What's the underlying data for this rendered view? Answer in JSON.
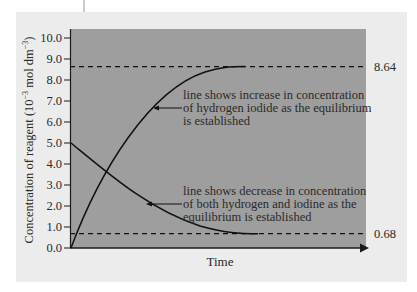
{
  "chart_data": {
    "type": "line",
    "title": "",
    "xlabel": "Time",
    "ylabel": "Concentration of reagent (10⁻³ mol dm⁻³)",
    "ylabel_parts": {
      "main": "Concentration of reagent (10",
      "exp1": "−3",
      "mid": " mol dm",
      "exp2": "−3",
      "end": ")"
    },
    "ylim": [
      0,
      10
    ],
    "yticks": [
      "0.0",
      "1.0",
      "2.0",
      "3.0",
      "4.0",
      "5.0",
      "6.0",
      "7.0",
      "8.0",
      "9.0",
      "10.0"
    ],
    "grid": false,
    "x_is_unlabeled_time": true,
    "series": [
      {
        "name": "hydrogen iodide",
        "trend": "increase",
        "start": 0.0,
        "equilibrium": 8.64,
        "points": [
          [
            0,
            0.0
          ],
          [
            0.1,
            3.1
          ],
          [
            0.2,
            5.6
          ],
          [
            0.3,
            7.3
          ],
          [
            0.4,
            8.3
          ],
          [
            0.5,
            8.64
          ],
          [
            0.55,
            8.64
          ]
        ]
      },
      {
        "name": "hydrogen and iodine",
        "trend": "decrease",
        "start": 5.0,
        "equilibrium": 0.68,
        "points": [
          [
            0,
            5.0
          ],
          [
            0.1,
            3.3
          ],
          [
            0.2,
            2.1
          ],
          [
            0.3,
            1.3
          ],
          [
            0.4,
            0.9
          ],
          [
            0.5,
            0.72
          ],
          [
            0.6,
            0.68
          ]
        ]
      }
    ],
    "reference_lines": [
      {
        "value": 8.64,
        "label": "8.64",
        "style": "dashed"
      },
      {
        "value": 0.68,
        "label": "0.68",
        "style": "dashed"
      }
    ],
    "annotations": [
      {
        "target": "hydrogen iodide",
        "lines": [
          "line shows increase in concentration",
          "of hydrogen iodide as the equilibrium",
          "is established"
        ]
      },
      {
        "target": "hydrogen and iodine",
        "lines": [
          "line shows decrease in concentration",
          "of both hydrogen and iodine as the",
          "equilibrium is established"
        ]
      }
    ]
  },
  "colors": {
    "page": "#ffffff",
    "panel": "#ececec",
    "plot_area": "#9e9e9e",
    "ink": "#1a1a1a"
  }
}
